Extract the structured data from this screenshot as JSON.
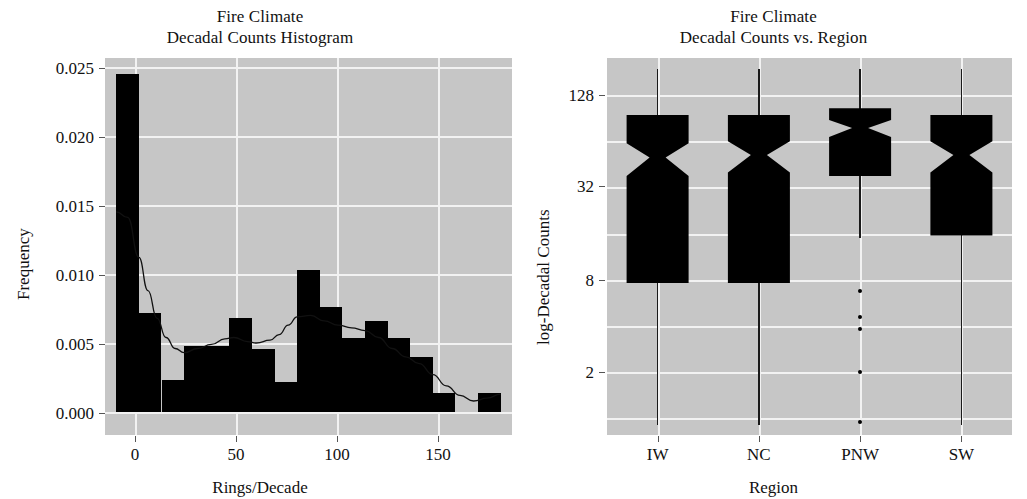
{
  "figure": {
    "background": "#ffffff",
    "panel_background": "#c6c6c6",
    "grid_color": "#f2f2f2",
    "ink_color": "#000000"
  },
  "chart_data": [
    {
      "type": "bar",
      "panel": "left",
      "title": "Fire Climate",
      "subtitle": "Decadal Counts Histogram",
      "title_line1": "Fire Climate",
      "title_line2": "Decadal Counts Histogram",
      "xlabel": "Rings/Decade",
      "ylabel": "Frequency",
      "xlim": [
        -5,
        175
      ],
      "ylim": [
        0,
        0.0262
      ],
      "xticks": [
        0,
        50,
        100,
        150
      ],
      "xtick_labels": [
        "0",
        "50",
        "100",
        "150"
      ],
      "yticks": [
        0.0,
        0.005,
        0.01,
        0.015,
        0.02,
        0.025
      ],
      "ytick_labels": [
        "0.000",
        "0.005",
        "0.010",
        "0.015",
        "0.020",
        "0.025"
      ],
      "grid": true,
      "bin_width": 10,
      "bin_starts": [
        0,
        10,
        20,
        30,
        40,
        50,
        60,
        70,
        80,
        90,
        100,
        110,
        120,
        130,
        140,
        150,
        160
      ],
      "categories": [
        "0-10",
        "10-20",
        "20-30",
        "30-40",
        "40-50",
        "50-60",
        "60-70",
        "70-80",
        "80-90",
        "90-100",
        "100-110",
        "110-120",
        "120-130",
        "130-140",
        "140-150",
        "150-160",
        "160-170"
      ],
      "values": [
        0.0245,
        0.0072,
        0.0023,
        0.0048,
        0.0048,
        0.0068,
        0.0046,
        0.0022,
        0.0103,
        0.0076,
        0.0054,
        0.0066,
        0.0054,
        0.004,
        0.0014,
        0.0,
        0.0014
      ],
      "density_curve": {
        "label": "density",
        "x": [
          0,
          5,
          10,
          14,
          18,
          22,
          26,
          30,
          36,
          42,
          48,
          52,
          58,
          62,
          68,
          72,
          76,
          80,
          86,
          92,
          98,
          104,
          110,
          116,
          122,
          128,
          134,
          140,
          146,
          152,
          158,
          164,
          170
        ],
        "y": [
          0.0145,
          0.0141,
          0.0112,
          0.0088,
          0.0068,
          0.0054,
          0.0046,
          0.0043,
          0.0046,
          0.0049,
          0.0053,
          0.0054,
          0.0051,
          0.005,
          0.0052,
          0.0056,
          0.0063,
          0.0069,
          0.007,
          0.0066,
          0.0063,
          0.0061,
          0.0059,
          0.0054,
          0.0046,
          0.004,
          0.0035,
          0.0027,
          0.0019,
          0.0012,
          0.0008,
          0.001,
          0.0013
        ]
      }
    },
    {
      "type": "boxplot",
      "panel": "right",
      "title": "Fire Climate",
      "subtitle": "Decadal Counts vs. Region",
      "title_line1": "Fire Climate",
      "title_line2": "Decadal Counts vs. Region",
      "xlabel": "Region",
      "ylabel": "log-Decadal Counts",
      "y_scale": "log2",
      "yticks": [
        2,
        8,
        32,
        128
      ],
      "ytick_labels": [
        "2",
        "8",
        "32",
        "128"
      ],
      "ylim": [
        0.8,
        260
      ],
      "grid": true,
      "notched": true,
      "categories": [
        "IW",
        "NC",
        "PNW",
        "SW"
      ],
      "boxes": [
        {
          "region": "IW",
          "whisker_low": 0.9,
          "q1": 7.6,
          "median": 50.0,
          "q3": 95.0,
          "whisker_high": 190.0,
          "notch_low": 38.0,
          "notch_high": 62.0,
          "outliers": []
        },
        {
          "region": "NC",
          "whisker_low": 0.9,
          "q1": 7.6,
          "median": 52.0,
          "q3": 95.0,
          "whisker_high": 190.0,
          "notch_low": 40.0,
          "notch_high": 64.0,
          "outliers": []
        },
        {
          "region": "PNW",
          "whisker_low": 15.0,
          "q1": 38.0,
          "median": 78.0,
          "q3": 105.0,
          "whisker_high": 190.0,
          "notch_low": 68.0,
          "notch_high": 88.0,
          "outliers": [
            6.8,
            4.6,
            3.8,
            2.0,
            0.95
          ]
        },
        {
          "region": "SW",
          "whisker_low": 0.9,
          "q1": 15.5,
          "median": 52.0,
          "q3": 95.0,
          "whisker_high": 190.0,
          "notch_low": 40.0,
          "notch_high": 64.0,
          "outliers": []
        }
      ]
    }
  ]
}
